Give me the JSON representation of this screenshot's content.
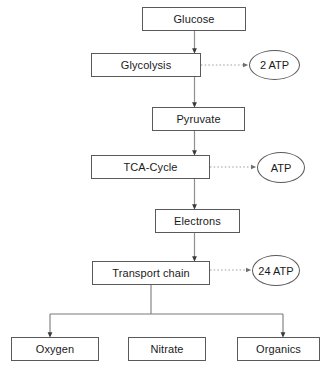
{
  "diagram": {
    "line_color": "#5a5a5a",
    "dotted_color": "#8c8c8c",
    "text_color": "#1a1a1a",
    "background": "#ffffff",
    "nodes": [
      {
        "id": "glucose",
        "label": "Glucose",
        "shape": "box",
        "x": 142,
        "y": 7,
        "w": 104,
        "h": 24
      },
      {
        "id": "glycolysis",
        "label": "Glycolysis",
        "shape": "box",
        "x": 91,
        "y": 53,
        "w": 110,
        "h": 24
      },
      {
        "id": "atp2",
        "label": "2 ATP",
        "shape": "ellipse",
        "x": 249,
        "y": 50,
        "w": 51,
        "h": 30
      },
      {
        "id": "pyruvate",
        "label": "Pyruvate",
        "shape": "box",
        "x": 152,
        "y": 107,
        "w": 93,
        "h": 24
      },
      {
        "id": "tca-cycle",
        "label": "TCA-Cycle",
        "shape": "box",
        "x": 91,
        "y": 155,
        "w": 119,
        "h": 24
      },
      {
        "id": "atp",
        "label": "ATP",
        "shape": "ellipse",
        "x": 257,
        "y": 152,
        "w": 48,
        "h": 31
      },
      {
        "id": "electrons",
        "label": "Electrons",
        "shape": "box",
        "x": 155,
        "y": 209,
        "w": 85,
        "h": 24
      },
      {
        "id": "transport-chain",
        "label": "Transport chain",
        "shape": "box",
        "x": 92,
        "y": 261,
        "w": 118,
        "h": 24
      },
      {
        "id": "atp24",
        "label": "24 ATP",
        "shape": "ellipse",
        "x": 252,
        "y": 255,
        "w": 48,
        "h": 31
      },
      {
        "id": "oxygen",
        "label": "Oxygen",
        "shape": "box",
        "x": 11,
        "y": 337,
        "w": 88,
        "h": 24
      },
      {
        "id": "nitrate",
        "label": "Nitrate",
        "shape": "box",
        "x": 128,
        "y": 337,
        "w": 78,
        "h": 24
      },
      {
        "id": "organics",
        "label": "Organics",
        "shape": "box",
        "x": 237,
        "y": 337,
        "w": 83,
        "h": 24
      }
    ],
    "edges": [
      {
        "id": "glucose-to-glycolysis",
        "from": "glucose",
        "to": "glycolysis",
        "style": "solid",
        "arrow": true
      },
      {
        "id": "glycolysis-to-2atp",
        "from": "glycolysis",
        "to": "atp2",
        "style": "dotted",
        "arrow": true
      },
      {
        "id": "glycolysis-to-pyruvate",
        "from": "glycolysis",
        "to": "pyruvate",
        "style": "solid",
        "arrow": true
      },
      {
        "id": "pyruvate-to-tca-cycle",
        "from": "pyruvate",
        "to": "tca-cycle",
        "style": "solid",
        "arrow": true
      },
      {
        "id": "tca-cycle-to-atp",
        "from": "tca-cycle",
        "to": "atp",
        "style": "dotted",
        "arrow": true
      },
      {
        "id": "tca-cycle-to-electrons",
        "from": "tca-cycle",
        "to": "electrons",
        "style": "solid",
        "arrow": true
      },
      {
        "id": "electrons-to-transport-chain",
        "from": "electrons",
        "to": "transport-chain",
        "style": "solid",
        "arrow": true
      },
      {
        "id": "transport-chain-to-24atp",
        "from": "transport-chain",
        "to": "atp24",
        "style": "dotted",
        "arrow": true
      },
      {
        "id": "transport-chain-to-oxygen",
        "from": "transport-chain",
        "to": "oxygen",
        "style": "solid",
        "arrow": true
      },
      {
        "id": "transport-chain-to-organics",
        "from": "transport-chain",
        "to": "organics",
        "style": "solid",
        "arrow": true
      }
    ]
  }
}
